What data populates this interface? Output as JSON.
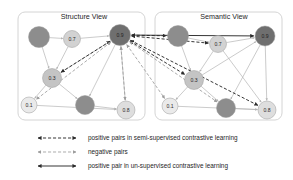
{
  "figure": {
    "type": "diagram",
    "width": 293,
    "height": 180,
    "background": "#ffffff"
  },
  "panels": [
    {
      "id": "structure-view",
      "title": "Structure View",
      "box": {
        "x": 18,
        "y": 12,
        "w": 127,
        "h": 108,
        "r": 7
      },
      "title_pos": {
        "x": 84,
        "y": 17
      }
    },
    {
      "id": "semantic-view",
      "title": "Semantic View",
      "box": {
        "x": 155,
        "y": 12,
        "w": 127,
        "h": 108,
        "r": 7
      },
      "title_pos": {
        "x": 224,
        "y": 17
      }
    }
  ],
  "colors": {
    "node_dark": "#8d8d8d",
    "node_darkest": "#6f6f6f",
    "node_mid": "#c4c4c4",
    "node_light": "#dedede",
    "node_lightest": "#eaeaea",
    "edge": "#b4b4b4",
    "panel_border": "#cfcfcf",
    "semi_supervised": "#2b2b2b",
    "negative": "#9d9d9d",
    "un_supervised": "#2b2b2b",
    "text": "#1e1e1e"
  },
  "nodes": {
    "structure": [
      {
        "id": "s-dark-top",
        "label": "",
        "x": 39,
        "y": 37,
        "r": 10.5,
        "fill": "#8d8d8d",
        "labeled": false
      },
      {
        "id": "s-07",
        "label": "0.7",
        "x": 72,
        "y": 39,
        "r": 8.5,
        "fill": "#d2d2d2",
        "labeled": true
      },
      {
        "id": "s-09",
        "label": "0.9",
        "x": 120,
        "y": 35,
        "r": 10.5,
        "fill": "#6f6f6f",
        "labeled": true
      },
      {
        "id": "s-03",
        "label": "0.3",
        "x": 52,
        "y": 78,
        "r": 9.5,
        "fill": "#c4c4c4",
        "labeled": true
      },
      {
        "id": "s-01",
        "label": "0.1",
        "x": 29,
        "y": 105,
        "r": 8.0,
        "fill": "#eaeaea",
        "labeled": true
      },
      {
        "id": "s-dark-bot",
        "label": "",
        "x": 85,
        "y": 105,
        "r": 9.5,
        "fill": "#8d8d8d",
        "labeled": false
      },
      {
        "id": "s-08",
        "label": "0.8",
        "x": 126,
        "y": 110,
        "r": 9.0,
        "fill": "#dedede",
        "labeled": true
      }
    ],
    "semantic": [
      {
        "id": "m-dark-top",
        "label": "",
        "x": 178,
        "y": 36,
        "r": 10.5,
        "fill": "#8d8d8d",
        "labeled": false
      },
      {
        "id": "m-07",
        "label": "0.7",
        "x": 218,
        "y": 44,
        "r": 8.5,
        "fill": "#d2d2d2",
        "labeled": true
      },
      {
        "id": "m-09",
        "label": "0.9",
        "x": 265,
        "y": 36,
        "r": 10.0,
        "fill": "#6f6f6f",
        "labeled": true
      },
      {
        "id": "m-03",
        "label": "0.3",
        "x": 194,
        "y": 80,
        "r": 9.5,
        "fill": "#c4c4c4",
        "labeled": true
      },
      {
        "id": "m-01",
        "label": "0.1",
        "x": 170,
        "y": 106,
        "r": 8.0,
        "fill": "#eaeaea",
        "labeled": true
      },
      {
        "id": "m-dark-bot",
        "label": "",
        "x": 226,
        "y": 108,
        "r": 9.5,
        "fill": "#8d8d8d",
        "labeled": false
      },
      {
        "id": "m-08",
        "label": "0.8",
        "x": 267,
        "y": 110,
        "r": 9.0,
        "fill": "#dedede",
        "labeled": true
      }
    ]
  },
  "graph_edges": {
    "structure": [
      [
        "s-dark-top",
        "s-07"
      ],
      [
        "s-dark-top",
        "s-03"
      ],
      [
        "s-07",
        "s-09"
      ],
      [
        "s-07",
        "s-03"
      ],
      [
        "s-03",
        "s-01"
      ],
      [
        "s-03",
        "s-dark-bot"
      ],
      [
        "s-03",
        "s-09"
      ],
      [
        "s-dark-bot",
        "s-08"
      ],
      [
        "s-01",
        "s-08"
      ],
      [
        "s-09",
        "s-08"
      ],
      [
        "s-09",
        "s-dark-bot"
      ]
    ],
    "semantic": [
      [
        "m-dark-top",
        "m-07"
      ],
      [
        "m-dark-top",
        "m-03"
      ],
      [
        "m-07",
        "m-09"
      ],
      [
        "m-07",
        "m-03"
      ],
      [
        "m-03",
        "m-01"
      ],
      [
        "m-03",
        "m-dark-bot"
      ],
      [
        "m-03",
        "m-09"
      ],
      [
        "m-dark-bot",
        "m-08"
      ],
      [
        "m-01",
        "m-08"
      ],
      [
        "m-09",
        "m-08"
      ],
      [
        "m-09",
        "m-dark-bot"
      ],
      [
        "m-07",
        "m-08"
      ]
    ]
  },
  "cross_links": [
    {
      "kind": "un_supervised",
      "from": "s-09",
      "to": "m-09"
    },
    {
      "kind": "semi_supervised",
      "from": "s-09",
      "to": "m-dark-top"
    },
    {
      "kind": "semi_supervised",
      "from": "s-09",
      "to": "m-07"
    },
    {
      "kind": "semi_supervised",
      "from": "s-09",
      "to": "m-03"
    },
    {
      "kind": "semi_supervised",
      "from": "s-09",
      "to": "m-08"
    },
    {
      "kind": "semi_supervised",
      "from": "s-09",
      "to": "s-03"
    },
    {
      "kind": "negative",
      "from": "s-09",
      "to": "s-01"
    },
    {
      "kind": "negative",
      "from": "s-09",
      "to": "m-01"
    },
    {
      "kind": "negative",
      "from": "s-09",
      "to": "s-08"
    },
    {
      "kind": "negative",
      "from": "s-09",
      "to": "m-dark-bot"
    }
  ],
  "legend": {
    "items": [
      {
        "id": "legend-semi-supervised",
        "style": "semi_supervised",
        "label": "positive pairs in semi-supervised contrastive learning",
        "y": 138
      },
      {
        "id": "legend-negative",
        "style": "negative",
        "label": "negative pairs",
        "y": 152
      },
      {
        "id": "legend-un-supervised",
        "style": "un_supervised",
        "label": "positive pair in un-supervised contrastive learning",
        "y": 166
      }
    ],
    "line_x1": 38,
    "line_x2": 76,
    "text_x": 88
  }
}
